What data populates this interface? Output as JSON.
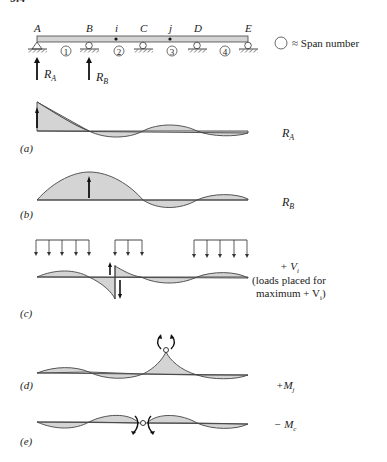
{
  "figure": {
    "header_partial": "9.4",
    "beam": {
      "support_labels": [
        "A",
        "B",
        "C",
        "D",
        "E"
      ],
      "point_labels": [
        "i",
        "j"
      ],
      "span_numbers": [
        "1",
        "2",
        "3",
        "4"
      ],
      "reactions": [
        "R",
        "R"
      ],
      "reaction_subscripts": [
        "A",
        "B"
      ],
      "legend_text": "≈ Span number"
    },
    "panels": [
      {
        "id": "a",
        "label": "(a)",
        "title": "R",
        "title_sub": "A"
      },
      {
        "id": "b",
        "label": "(b)",
        "title": "R",
        "title_sub": "B"
      },
      {
        "id": "c",
        "label": "(c)",
        "title": "+ V",
        "title_sub": "i",
        "note_line1": "(loads placed for",
        "note_line2": "maximum + V",
        "note_line2_sub": "i",
        "note_line2_end": ")"
      },
      {
        "id": "d",
        "label": "(d)",
        "title": "+M",
        "title_sub": "j"
      },
      {
        "id": "e",
        "label": "(e)",
        "title": "− M",
        "title_sub": "c"
      }
    ]
  },
  "colors": {
    "fill": "#d4d4d4",
    "stroke": "#444444",
    "text": "#222222"
  }
}
